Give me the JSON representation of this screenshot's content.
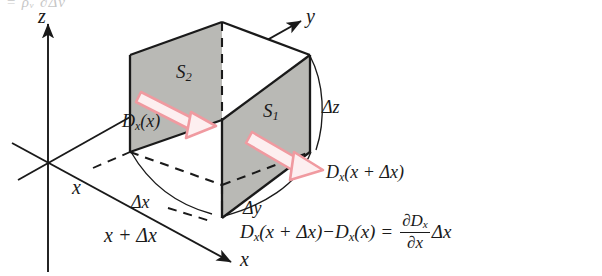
{
  "figure": {
    "caption_fragment": "= ρᵥ ∂Δν",
    "axes": {
      "z_label": "z",
      "y_label": "y",
      "x_label": "x",
      "x_origin_label": "x",
      "x_plus_label": "x + Δx"
    },
    "cube": {
      "face_back_label": "S",
      "face_back_sub": "2",
      "face_front_label": "S",
      "face_front_sub": "1",
      "dim_x": "Δx",
      "dim_y": "Δy",
      "dim_z": "Δz"
    },
    "flux": {
      "in_label_main": "D",
      "in_label_sub": "x",
      "in_label_arg": "(x)",
      "out_label_main": "D",
      "out_label_sub": "x",
      "out_label_arg": "(x + Δx)"
    },
    "equation": {
      "lhs_1_main": "D",
      "lhs_1_sub": "x",
      "lhs_1_arg": "(x + Δx)",
      "minus": "−",
      "lhs_2_main": "D",
      "lhs_2_sub": "x",
      "lhs_2_arg": "(x)",
      "equals": "=",
      "frac_num_d": "∂D",
      "frac_num_sub": "x",
      "frac_den": "∂x",
      "rhs_tail": "Δx"
    },
    "colors": {
      "ink": "#1a1a1a",
      "face_fill": "#b9b9b5",
      "arrow_stroke": "#f09aa0",
      "arrow_fill": "#fdeff0",
      "background": "#ffffff"
    }
  }
}
